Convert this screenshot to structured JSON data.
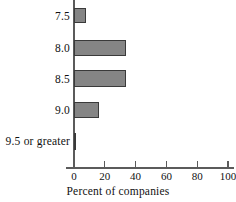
{
  "chart_data": {
    "type": "bar",
    "orientation": "horizontal",
    "title": "",
    "xlabel": "Percent of companies",
    "ylabel": "",
    "categories": [
      "7.5",
      "8.0",
      "8.5",
      "9.0",
      "9.5 or greater"
    ],
    "values": [
      8,
      34,
      34,
      16,
      1.5
    ],
    "xlim": [
      0,
      100
    ],
    "xticks": [
      0,
      20,
      40,
      60,
      80,
      100
    ],
    "xtick_labels": [
      "0",
      "20",
      "40",
      "60",
      "80",
      "100"
    ],
    "grid": false,
    "legend": null,
    "series": [
      {
        "name": "Percent of companies",
        "values": [
          8,
          34,
          34,
          16,
          1.5
        ]
      }
    ],
    "colors": {
      "bar_fill": "#858585",
      "bar_border": "#3a3a3a",
      "axis": "#5b5b5b",
      "text": "#111111",
      "background": "#ffffff"
    }
  }
}
